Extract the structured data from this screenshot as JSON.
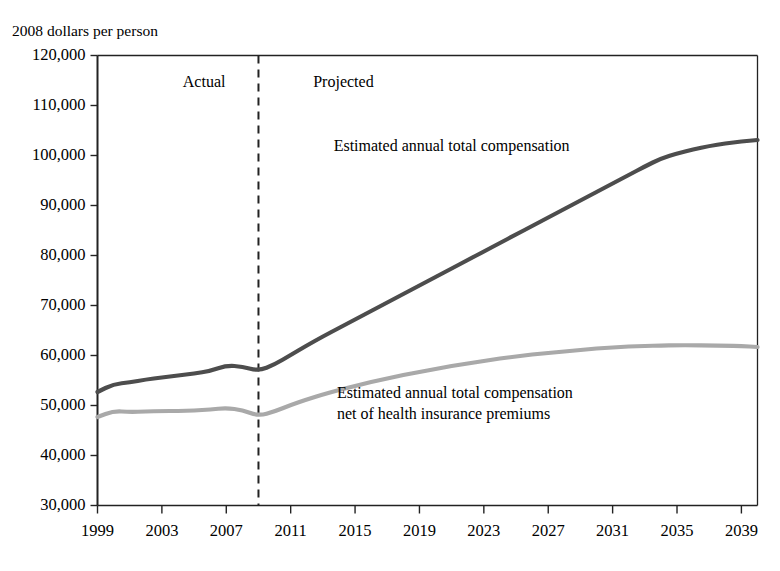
{
  "chart_data": {
    "type": "line",
    "title": "",
    "axis_caption": "2008 dollars per person",
    "xlabel": "",
    "ylabel": "",
    "xlim": [
      1999,
      2040
    ],
    "ylim": [
      30000,
      120000
    ],
    "grid": false,
    "legend_position": "inline-annotation",
    "x_tick_labels": [
      "1999",
      "2003",
      "2007",
      "2011",
      "2015",
      "2019",
      "2023",
      "2027",
      "2031",
      "2035",
      "2039"
    ],
    "x_tick_values": [
      1999,
      2003,
      2007,
      2011,
      2015,
      2019,
      2023,
      2027,
      2031,
      2035,
      2039
    ],
    "y_tick_labels": [
      "120,000",
      "110,000",
      "100,000",
      "90,000",
      "80,000",
      "70,000",
      "60,000",
      "50,000",
      "40,000",
      "30,000"
    ],
    "y_tick_values": [
      120000,
      110000,
      100000,
      90000,
      80000,
      70000,
      60000,
      50000,
      40000,
      30000
    ],
    "region_divider": {
      "x": 2009,
      "style": "dashed",
      "color": "#222222"
    },
    "region_labels": [
      {
        "text": "Actual",
        "x": 2004.3,
        "y": 114500
      },
      {
        "text": "Projected",
        "x": 2012.4,
        "y": 114500
      }
    ],
    "annotations": [
      {
        "id": "total-compensation-annotation",
        "lines": [
          "Estimated annual total compensation"
        ],
        "x": 2021.0,
        "y": 102000,
        "series": "total_compensation"
      },
      {
        "id": "net-compensation-annotation",
        "lines": [
          "Estimated annual total compensation",
          "net of health insurance premiums"
        ],
        "x": 2021.2,
        "y": 52500,
        "series": "net_of_premiums"
      }
    ],
    "x": [
      1999,
      2000,
      2001,
      2002,
      2003,
      2004,
      2005,
      2006,
      2007,
      2008,
      2009,
      2010,
      2011,
      2012,
      2013,
      2014,
      2015,
      2016,
      2017,
      2018,
      2019,
      2020,
      2021,
      2022,
      2023,
      2024,
      2025,
      2026,
      2027,
      2028,
      2029,
      2030,
      2031,
      2032,
      2033,
      2034,
      2035,
      2036,
      2037,
      2038,
      2039,
      2040
    ],
    "series": [
      {
        "name": "Estimated annual total compensation",
        "key": "total_compensation",
        "color": "#4d4d4d",
        "width": 4.2,
        "values": [
          52700,
          54300,
          54600,
          55200,
          55600,
          56000,
          56400,
          56900,
          58000,
          57800,
          56900,
          58200,
          60100,
          62000,
          63800,
          65500,
          67200,
          68900,
          70600,
          72300,
          74000,
          75700,
          77400,
          79100,
          80800,
          82500,
          84200,
          85900,
          87600,
          89300,
          91000,
          92700,
          94400,
          96100,
          97800,
          99400,
          100400,
          101200,
          101900,
          102400,
          102800,
          103100
        ]
      },
      {
        "name": "Estimated annual total compensation net of health insurance premiums",
        "key": "net_of_premiums",
        "color": "#a9a9a9",
        "width": 4.2,
        "values": [
          47700,
          48900,
          48700,
          48800,
          48900,
          48900,
          49000,
          49200,
          49500,
          49100,
          47900,
          48800,
          50100,
          51200,
          52200,
          53100,
          53900,
          54700,
          55400,
          56100,
          56700,
          57300,
          57900,
          58400,
          58900,
          59400,
          59800,
          60200,
          60500,
          60800,
          61100,
          61400,
          61600,
          61800,
          61900,
          62000,
          62050,
          62050,
          62000,
          61950,
          61900,
          61700
        ]
      }
    ]
  },
  "colors": {
    "axis": "#222222",
    "text": "#000000",
    "background": "#ffffff",
    "series_dark": "#4d4d4d",
    "series_light": "#a9a9a9",
    "divider": "#222222"
  }
}
